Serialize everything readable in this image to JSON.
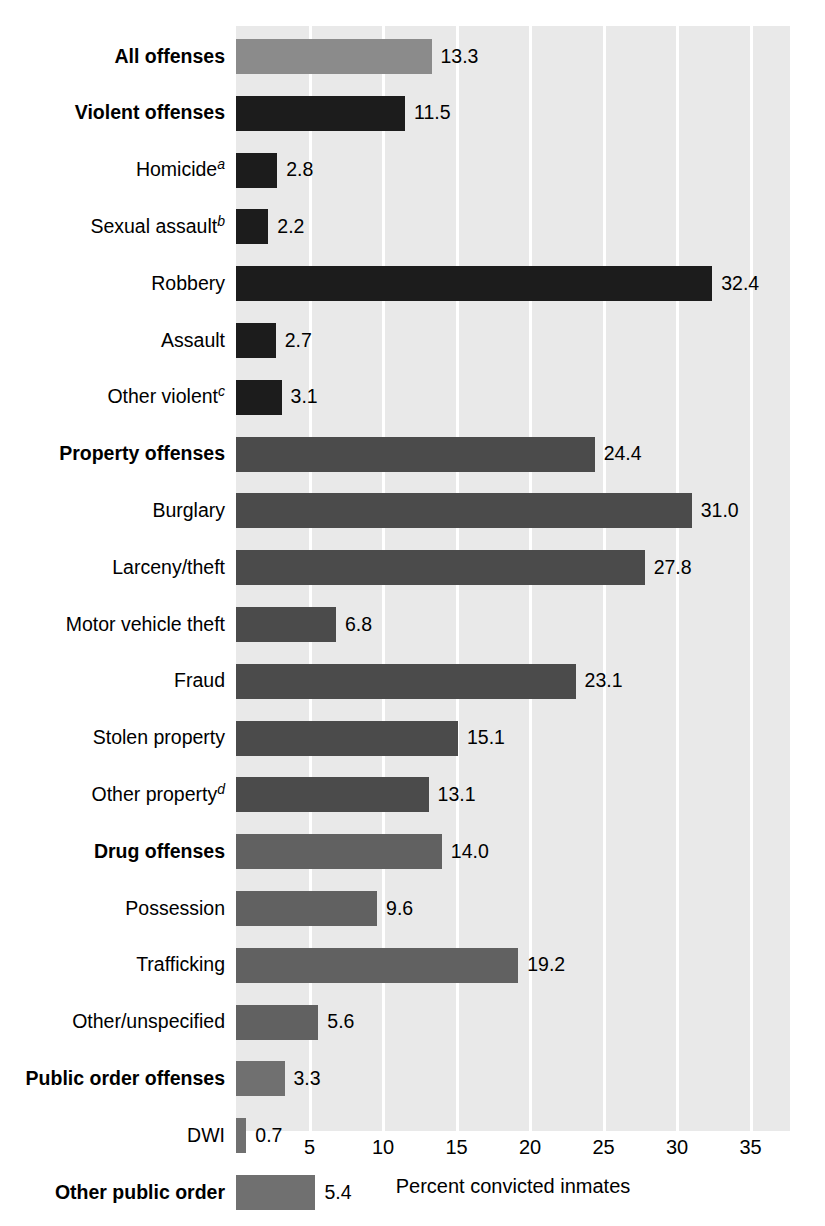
{
  "chart_data": {
    "type": "bar",
    "orientation": "horizontal",
    "title": "",
    "xlabel": "Percent convicted inmates",
    "ylabel": "",
    "xlim": [
      0,
      37.7
    ],
    "xticks": [
      5,
      10,
      15,
      20,
      25,
      30,
      35
    ],
    "xtick_labels": [
      "5",
      "10",
      "15",
      "20",
      "25",
      "30",
      "35"
    ],
    "grid": "vertical-white-gridlines",
    "legend": "none",
    "plot_background": "#e9e9e9",
    "categories": [
      "All offenses",
      "Violent offenses",
      "Homicide",
      "Sexual assault",
      "Robbery",
      "Assault",
      "Other violent",
      "Property offenses",
      "Burglary",
      "Larceny/theft",
      "Motor vehicle theft",
      "Fraud",
      "Stolen property",
      "Other property",
      "Drug offenses",
      "Possession",
      "Trafficking",
      "Other/unspecified",
      "Public order offenses",
      "DWI",
      "Other public order"
    ],
    "values": [
      13.3,
      11.5,
      2.8,
      2.2,
      32.4,
      2.7,
      3.1,
      24.4,
      31.0,
      27.8,
      6.8,
      23.1,
      15.1,
      13.1,
      14.0,
      9.6,
      19.2,
      5.6,
      3.3,
      0.7,
      5.4
    ],
    "value_labels": [
      "13.3",
      "11.5",
      "2.8",
      "2.2",
      "32.4",
      "2.7",
      "3.1",
      "24.4",
      "31.0",
      "27.8",
      "6.8",
      "23.1",
      "15.1",
      "13.1",
      "14.0",
      "9.6",
      "19.2",
      "5.6",
      "3.3",
      "0.7",
      "5.4"
    ],
    "rows": [
      {
        "label": "All offenses",
        "sup": "",
        "value": 13.3,
        "value_label": "13.3",
        "bold": true,
        "color": "#8b8b8b"
      },
      {
        "label": "Violent offenses",
        "sup": "",
        "value": 11.5,
        "value_label": "11.5",
        "bold": true,
        "color": "#1c1c1c"
      },
      {
        "label": "Homicide",
        "sup": "a",
        "value": 2.8,
        "value_label": "2.8",
        "bold": false,
        "color": "#1c1c1c"
      },
      {
        "label": "Sexual assault",
        "sup": "b",
        "value": 2.2,
        "value_label": "2.2",
        "bold": false,
        "color": "#1c1c1c"
      },
      {
        "label": "Robbery",
        "sup": "",
        "value": 32.4,
        "value_label": "32.4",
        "bold": false,
        "color": "#1c1c1c"
      },
      {
        "label": "Assault",
        "sup": "",
        "value": 2.7,
        "value_label": "2.7",
        "bold": false,
        "color": "#1c1c1c"
      },
      {
        "label": "Other violent",
        "sup": "c",
        "value": 3.1,
        "value_label": "3.1",
        "bold": false,
        "color": "#1c1c1c"
      },
      {
        "label": "Property offenses",
        "sup": "",
        "value": 24.4,
        "value_label": "24.4",
        "bold": true,
        "color": "#4b4b4b"
      },
      {
        "label": "Burglary",
        "sup": "",
        "value": 31.0,
        "value_label": "31.0",
        "bold": false,
        "color": "#4b4b4b"
      },
      {
        "label": "Larceny/theft",
        "sup": "",
        "value": 27.8,
        "value_label": "27.8",
        "bold": false,
        "color": "#4b4b4b"
      },
      {
        "label": "Motor vehicle theft",
        "sup": "",
        "value": 6.8,
        "value_label": "6.8",
        "bold": false,
        "color": "#4b4b4b"
      },
      {
        "label": "Fraud",
        "sup": "",
        "value": 23.1,
        "value_label": "23.1",
        "bold": false,
        "color": "#4b4b4b"
      },
      {
        "label": "Stolen property",
        "sup": "",
        "value": 15.1,
        "value_label": "15.1",
        "bold": false,
        "color": "#4b4b4b"
      },
      {
        "label": "Other property",
        "sup": "d",
        "value": 13.1,
        "value_label": "13.1",
        "bold": false,
        "color": "#4b4b4b"
      },
      {
        "label": "Drug offenses",
        "sup": "",
        "value": 14.0,
        "value_label": "14.0",
        "bold": true,
        "color": "#616161"
      },
      {
        "label": "Possession",
        "sup": "",
        "value": 9.6,
        "value_label": "9.6",
        "bold": false,
        "color": "#616161"
      },
      {
        "label": "Trafficking",
        "sup": "",
        "value": 19.2,
        "value_label": "19.2",
        "bold": false,
        "color": "#616161"
      },
      {
        "label": "Other/unspecified",
        "sup": "",
        "value": 5.6,
        "value_label": "5.6",
        "bold": false,
        "color": "#616161"
      },
      {
        "label": "Public order offenses",
        "sup": "",
        "value": 3.3,
        "value_label": "3.3",
        "bold": true,
        "color": "#707070"
      },
      {
        "label": "DWI",
        "sup": "",
        "value": 0.7,
        "value_label": "0.7",
        "bold": false,
        "color": "#707070"
      },
      {
        "label": "Other public order",
        "sup": "",
        "value": 5.4,
        "value_label": "5.4",
        "bold": true,
        "color": "#707070"
      }
    ]
  },
  "axis": {
    "title": "Percent convicted inmates",
    "ticks": [
      "5",
      "10",
      "15",
      "20",
      "25",
      "30",
      "35"
    ]
  }
}
